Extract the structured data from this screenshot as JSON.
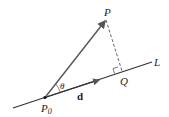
{
  "diagram": {
    "labels": {
      "point_p": "P",
      "point_p0_base": "P",
      "point_p0_sub": "0",
      "point_q": "Q",
      "line_l": "L",
      "angle": "θ",
      "direction_vector": "d"
    },
    "colors": {
      "line": "#333333",
      "vector": "#555555",
      "dashed": "#666666",
      "text": "#222222"
    }
  }
}
